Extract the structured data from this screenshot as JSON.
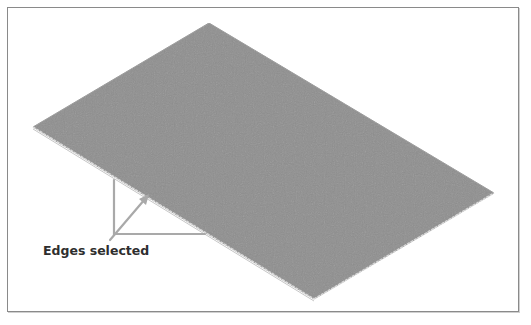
{
  "figure": {
    "annotation": {
      "label": "Edges selected"
    },
    "colors": {
      "plate_fill": "#8f8f8f",
      "plate_edge": "#9a9a9a",
      "selected_edge": "#d8d8d8",
      "callout_line": "#a9a9a9",
      "label_text": "#2e2e2e",
      "frame_border": "#8a8a8a"
    }
  }
}
